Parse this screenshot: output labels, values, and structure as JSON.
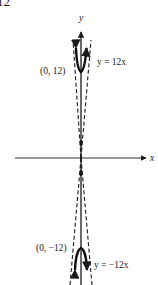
{
  "figure": {
    "problem_number": "12",
    "axes": {
      "x_label": "x",
      "y_label": "y"
    },
    "curves": [
      {
        "name": "upper-curve",
        "equation_label": "y = 12x",
        "vertex_label": "(0, 12)",
        "vertex": [
          0,
          12
        ],
        "opens": "up"
      },
      {
        "name": "lower-curve",
        "equation_label": "y = −12x",
        "vertex_label": "(0, −12)",
        "vertex": [
          0,
          -12
        ],
        "opens": "down"
      }
    ],
    "asymptote_style": "dashed",
    "colors": {
      "ink": "#1a1a1a",
      "background": "#ffffff"
    }
  }
}
